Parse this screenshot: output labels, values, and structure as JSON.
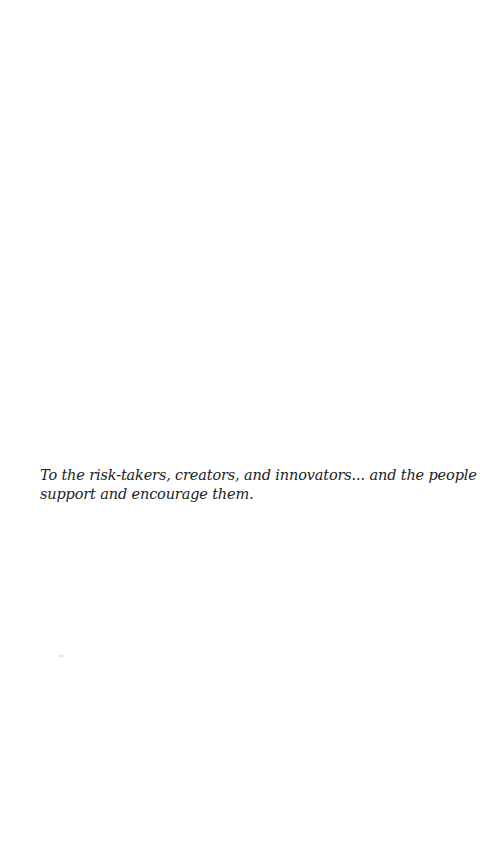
{
  "page": {
    "background": "#ffffff",
    "text_color": "#222222"
  },
  "dedication": {
    "lines": [
      "To the risk-takers, creators, and innovators... and the people that",
      "support and encourage them."
    ]
  }
}
